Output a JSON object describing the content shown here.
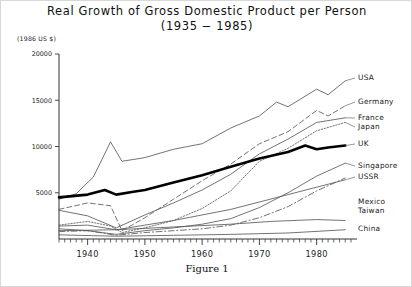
{
  "figure": {
    "title_line1": "Real Growth of Gross Domestic Product per Person",
    "title_line2": "(1935 − 1985)",
    "units_label": "(1986 US $)",
    "caption": "Figure 1"
  },
  "chart_data": {
    "type": "line",
    "title": "Real Growth of Gross Domestic Product per Person (1935 − 1985)",
    "xlabel": "",
    "ylabel": "(1986 US $)",
    "xlim": [
      1935,
      1986
    ],
    "ylim": [
      0,
      20000
    ],
    "grid": false,
    "legend_position": "right-inline-labels",
    "yticks": [
      0,
      5000,
      10000,
      15000,
      20000
    ],
    "ytick_labels": [
      "",
      "5000",
      "10000",
      "15000",
      "20000"
    ],
    "xticks": [
      1940,
      1950,
      1960,
      1970,
      1980
    ],
    "xtick_labels": [
      "1940",
      "1950",
      "1960",
      "1970",
      "1980"
    ],
    "minor_xticks_every": 1,
    "series": [
      {
        "name": "USA",
        "style": "solid-thin",
        "x": [
          1935,
          1938,
          1941,
          1944,
          1946,
          1950,
          1955,
          1960,
          1965,
          1970,
          1973,
          1975,
          1980,
          1982,
          1985
        ],
        "values": [
          4300,
          4900,
          6700,
          10500,
          8400,
          8800,
          9700,
          10300,
          12000,
          13300,
          14800,
          14300,
          16200,
          15600,
          17100
        ]
      },
      {
        "name": "Germany",
        "style": "dashed",
        "x": [
          1935,
          1940,
          1944,
          1946,
          1950,
          1955,
          1960,
          1965,
          1970,
          1975,
          1980,
          1982,
          1985
        ],
        "values": [
          3200,
          3900,
          3600,
          900,
          2300,
          4300,
          6300,
          8100,
          10300,
          11600,
          13900,
          13300,
          14400
        ]
      },
      {
        "name": "France",
        "style": "solid-thin",
        "x": [
          1935,
          1940,
          1945,
          1950,
          1955,
          1960,
          1965,
          1970,
          1975,
          1980,
          1985
        ],
        "values": [
          3100,
          2500,
          1200,
          2600,
          3900,
          5300,
          7000,
          9200,
          10800,
          12600,
          13100
        ]
      },
      {
        "name": "Japan",
        "style": "dotted",
        "x": [
          1935,
          1940,
          1944,
          1946,
          1950,
          1955,
          1960,
          1965,
          1970,
          1975,
          1980,
          1985
        ],
        "values": [
          1500,
          1900,
          1400,
          700,
          1200,
          2000,
          3300,
          5200,
          8400,
          9800,
          11700,
          12600
        ]
      },
      {
        "name": "UK",
        "style": "thick",
        "x": [
          1935,
          1940,
          1943,
          1945,
          1948,
          1950,
          1955,
          1960,
          1965,
          1970,
          1975,
          1978,
          1980,
          1982,
          1985
        ],
        "values": [
          4500,
          4800,
          5300,
          4800,
          5100,
          5300,
          6100,
          6900,
          7800,
          8700,
          9400,
          10100,
          9700,
          9900,
          10100
        ]
      },
      {
        "name": "Singapore",
        "style": "solid-thin",
        "x": [
          1935,
          1940,
          1945,
          1950,
          1955,
          1960,
          1965,
          1970,
          1975,
          1980,
          1985
        ],
        "values": [
          1100,
          900,
          500,
          900,
          1200,
          1600,
          2200,
          3400,
          5000,
          6800,
          8200
        ]
      },
      {
        "name": "USSR",
        "style": "solid-thin",
        "x": [
          1935,
          1940,
          1945,
          1950,
          1955,
          1960,
          1965,
          1970,
          1975,
          1980,
          1985
        ],
        "values": [
          1400,
          1500,
          1000,
          1500,
          2000,
          2600,
          3200,
          4000,
          4800,
          5600,
          6400
        ]
      },
      {
        "name": "Mexico",
        "style": "solid-thin",
        "x": [
          1935,
          1945,
          1955,
          1965,
          1972,
          1980,
          1985
        ],
        "values": [
          900,
          1000,
          1300,
          1600,
          1900,
          2100,
          2000
        ]
      },
      {
        "name": "Taiwan",
        "style": "dashdot",
        "x": [
          1935,
          1940,
          1945,
          1950,
          1955,
          1960,
          1965,
          1970,
          1975,
          1980,
          1985
        ],
        "values": [
          800,
          900,
          400,
          700,
          900,
          1100,
          1500,
          2300,
          3500,
          5200,
          6600
        ]
      },
      {
        "name": "China",
        "style": "solid-thin",
        "x": [
          1935,
          1945,
          1955,
          1965,
          1975,
          1985
        ],
        "values": [
          450,
          300,
          400,
          500,
          650,
          1000
        ]
      }
    ],
    "annotations": [
      {
        "text": "USA",
        "y_value": 17100
      },
      {
        "text": "Germany",
        "y_value": 14400
      },
      {
        "text": "France",
        "y_value": 13100
      },
      {
        "text": "Japan",
        "y_value": 12600
      },
      {
        "text": "UK",
        "y_value": 10100
      },
      {
        "text": "Singapore",
        "y_value": 8200
      },
      {
        "text": "USSR",
        "y_value": 6400
      },
      {
        "text": "Mexico",
        "y_value": 2000
      },
      {
        "text": "Taiwan",
        "y_value": 6600
      },
      {
        "text": "China",
        "y_value": 1000
      }
    ]
  },
  "legend": {
    "items": [
      {
        "label": "USA"
      },
      {
        "label": "Germany"
      },
      {
        "label": "France"
      },
      {
        "label": "Japan"
      },
      {
        "label": "UK"
      },
      {
        "label": "Singapore"
      },
      {
        "label": "USSR"
      },
      {
        "label": "Mexico"
      },
      {
        "label": "Taiwan"
      },
      {
        "label": "China"
      }
    ]
  }
}
